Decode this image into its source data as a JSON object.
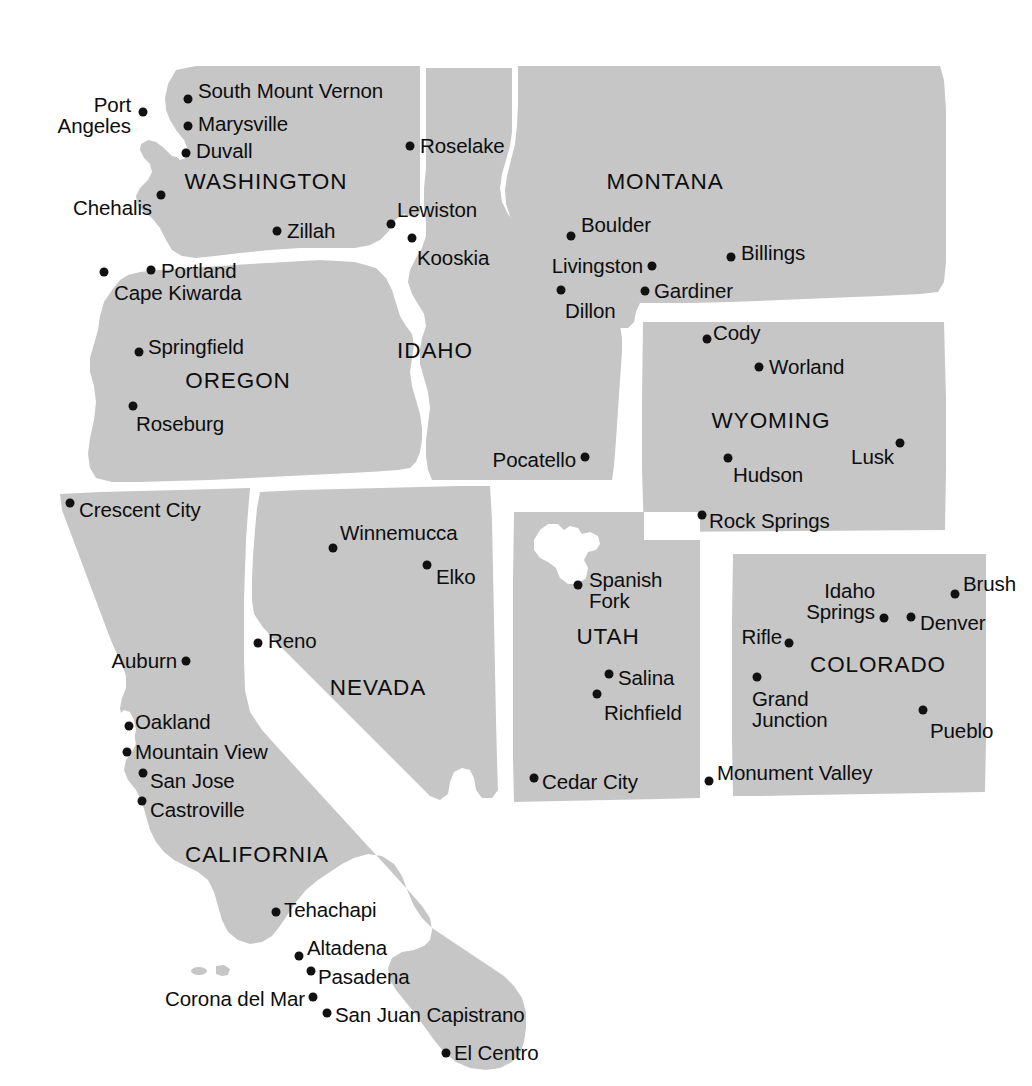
{
  "map": {
    "title": "Western United States",
    "colors": {
      "land": "#c6c6c6",
      "background": "#ffffff",
      "border": "#ffffff",
      "dot": "#111111",
      "text": "#0d0d0d",
      "lake": "#ffffff"
    },
    "width": 1032,
    "height": 1086
  },
  "states": [
    {
      "name": "WASHINGTON",
      "x": 266,
      "y": 182
    },
    {
      "name": "OREGON",
      "x": 238,
      "y": 381
    },
    {
      "name": "IDAHO",
      "x": 435,
      "y": 351
    },
    {
      "name": "MONTANA",
      "x": 665,
      "y": 182
    },
    {
      "name": "WYOMING",
      "x": 771,
      "y": 421
    },
    {
      "name": "NEVADA",
      "x": 378,
      "y": 688
    },
    {
      "name": "UTAH",
      "x": 608,
      "y": 637
    },
    {
      "name": "COLORADO",
      "x": 878,
      "y": 665
    },
    {
      "name": "CALIFORNIA",
      "x": 257,
      "y": 855
    }
  ],
  "cities": [
    {
      "name": "Port\nAngeles",
      "dot_x": 143,
      "dot_y": 112,
      "label_x": 131,
      "label_y": 115,
      "anchor": "end",
      "multiline": true
    },
    {
      "name": "South Mount Vernon",
      "dot_x": 188,
      "dot_y": 99,
      "label_x": 198,
      "label_y": 91,
      "anchor": "start"
    },
    {
      "name": "Marysville",
      "dot_x": 188,
      "dot_y": 126,
      "label_x": 198,
      "label_y": 124,
      "anchor": "start"
    },
    {
      "name": "Duvall",
      "dot_x": 186,
      "dot_y": 153,
      "label_x": 196,
      "label_y": 151,
      "anchor": "start"
    },
    {
      "name": "Chehalis",
      "dot_x": 161,
      "dot_y": 195,
      "label_x": 152,
      "label_y": 208,
      "anchor": "end"
    },
    {
      "name": "Zillah",
      "dot_x": 277,
      "dot_y": 231,
      "label_x": 287,
      "label_y": 231,
      "anchor": "start"
    },
    {
      "name": "Portland",
      "dot_x": 151,
      "dot_y": 270,
      "label_x": 161,
      "label_y": 271,
      "anchor": "start"
    },
    {
      "name": "Cape Kiwarda",
      "dot_x": 104,
      "dot_y": 272,
      "label_x": 114,
      "label_y": 293,
      "anchor": "start"
    },
    {
      "name": "Springfield",
      "dot_x": 139,
      "dot_y": 352,
      "label_x": 148,
      "label_y": 347,
      "anchor": "start"
    },
    {
      "name": "Roseburg",
      "dot_x": 133,
      "dot_y": 406,
      "label_x": 136,
      "label_y": 424,
      "anchor": "start"
    },
    {
      "name": "Roselake",
      "dot_x": 410,
      "dot_y": 146,
      "label_x": 420,
      "label_y": 146,
      "anchor": "start"
    },
    {
      "name": "Lewiston",
      "dot_x": 391,
      "dot_y": 224,
      "label_x": 397,
      "label_y": 210,
      "anchor": "start"
    },
    {
      "name": "Kooskia",
      "dot_x": 412,
      "dot_y": 238,
      "label_x": 417,
      "label_y": 258,
      "anchor": "start"
    },
    {
      "name": "Pocatello",
      "dot_x": 585,
      "dot_y": 457,
      "label_x": 576,
      "label_y": 460,
      "anchor": "end"
    },
    {
      "name": "Boulder",
      "dot_x": 571,
      "dot_y": 236,
      "label_x": 581,
      "label_y": 225,
      "anchor": "start"
    },
    {
      "name": "Livingston",
      "dot_x": 652,
      "dot_y": 266,
      "label_x": 643,
      "label_y": 266,
      "anchor": "end"
    },
    {
      "name": "Billings",
      "dot_x": 731,
      "dot_y": 257,
      "label_x": 741,
      "label_y": 253,
      "anchor": "start"
    },
    {
      "name": "Dillon",
      "dot_x": 561,
      "dot_y": 290,
      "label_x": 565,
      "label_y": 311,
      "anchor": "start"
    },
    {
      "name": "Gardiner",
      "dot_x": 645,
      "dot_y": 291,
      "label_x": 654,
      "label_y": 291,
      "anchor": "start"
    },
    {
      "name": "Cody",
      "dot_x": 707,
      "dot_y": 339,
      "label_x": 713,
      "label_y": 333,
      "anchor": "start"
    },
    {
      "name": "Worland",
      "dot_x": 759,
      "dot_y": 367,
      "label_x": 769,
      "label_y": 367,
      "anchor": "start"
    },
    {
      "name": "Hudson",
      "dot_x": 728,
      "dot_y": 458,
      "label_x": 733,
      "label_y": 475,
      "anchor": "start"
    },
    {
      "name": "Lusk",
      "dot_x": 900,
      "dot_y": 443,
      "label_x": 894,
      "label_y": 457,
      "anchor": "end"
    },
    {
      "name": "Rock Springs",
      "dot_x": 702,
      "dot_y": 515,
      "label_x": 709,
      "label_y": 521,
      "anchor": "start"
    },
    {
      "name": "Crescent City",
      "dot_x": 70,
      "dot_y": 503,
      "label_x": 79,
      "label_y": 510,
      "anchor": "start"
    },
    {
      "name": "Winnemucca",
      "dot_x": 333,
      "dot_y": 548,
      "label_x": 340,
      "label_y": 533,
      "anchor": "start"
    },
    {
      "name": "Elko",
      "dot_x": 427,
      "dot_y": 565,
      "label_x": 436,
      "label_y": 577,
      "anchor": "start"
    },
    {
      "name": "Reno",
      "dot_x": 258,
      "dot_y": 643,
      "label_x": 268,
      "label_y": 641,
      "anchor": "start"
    },
    {
      "name": "Auburn",
      "dot_x": 186,
      "dot_y": 661,
      "label_x": 177,
      "label_y": 661,
      "anchor": "end"
    },
    {
      "name": "Oakland",
      "dot_x": 129,
      "dot_y": 726,
      "label_x": 135,
      "label_y": 722,
      "anchor": "start"
    },
    {
      "name": "Mountain View",
      "dot_x": 127,
      "dot_y": 752,
      "label_x": 135,
      "label_y": 752,
      "anchor": "start"
    },
    {
      "name": "San Jose",
      "dot_x": 143,
      "dot_y": 773,
      "label_x": 150,
      "label_y": 781,
      "anchor": "start"
    },
    {
      "name": "Castroville",
      "dot_x": 142,
      "dot_y": 801,
      "label_x": 150,
      "label_y": 810,
      "anchor": "start"
    },
    {
      "name": "Tehachapi",
      "dot_x": 276,
      "dot_y": 912,
      "label_x": 284,
      "label_y": 910,
      "anchor": "start"
    },
    {
      "name": "Altadena",
      "dot_x": 299,
      "dot_y": 956,
      "label_x": 307,
      "label_y": 948,
      "anchor": "start"
    },
    {
      "name": "Pasadena",
      "dot_x": 311,
      "dot_y": 971,
      "label_x": 318,
      "label_y": 977,
      "anchor": "start"
    },
    {
      "name": "Corona del Mar",
      "dot_x": 313,
      "dot_y": 997,
      "label_x": 305,
      "label_y": 999,
      "anchor": "end"
    },
    {
      "name": "San Juan Capistrano",
      "dot_x": 327,
      "dot_y": 1013,
      "label_x": 335,
      "label_y": 1015,
      "anchor": "start"
    },
    {
      "name": "El Centro",
      "dot_x": 446,
      "dot_y": 1053,
      "label_x": 454,
      "label_y": 1053,
      "anchor": "start"
    },
    {
      "name": "Spanish\nFork",
      "dot_x": 578,
      "dot_y": 585,
      "label_x": 589,
      "label_y": 590,
      "anchor": "start",
      "multiline": true
    },
    {
      "name": "Salina",
      "dot_x": 609,
      "dot_y": 674,
      "label_x": 618,
      "label_y": 678,
      "anchor": "start"
    },
    {
      "name": "Richfield",
      "dot_x": 597,
      "dot_y": 694,
      "label_x": 604,
      "label_y": 713,
      "anchor": "start"
    },
    {
      "name": "Cedar City",
      "dot_x": 534,
      "dot_y": 778,
      "label_x": 542,
      "label_y": 782,
      "anchor": "start"
    },
    {
      "name": "Monument Valley",
      "dot_x": 709,
      "dot_y": 781,
      "label_x": 717,
      "label_y": 773,
      "anchor": "start"
    },
    {
      "name": "Idaho\nSprings",
      "dot_x": 884,
      "dot_y": 618,
      "label_x": 875,
      "label_y": 601,
      "anchor": "end",
      "multiline": true
    },
    {
      "name": "Brush",
      "dot_x": 955,
      "dot_y": 594,
      "label_x": 963,
      "label_y": 584,
      "anchor": "start"
    },
    {
      "name": "Denver",
      "dot_x": 911,
      "dot_y": 617,
      "label_x": 920,
      "label_y": 623,
      "anchor": "start"
    },
    {
      "name": "Rifle",
      "dot_x": 789,
      "dot_y": 643,
      "label_x": 782,
      "label_y": 637,
      "anchor": "end"
    },
    {
      "name": "Grand\nJunction",
      "dot_x": 757,
      "dot_y": 677,
      "label_x": 752,
      "label_y": 709,
      "anchor": "start",
      "multiline": true
    },
    {
      "name": "Pueblo",
      "dot_x": 923,
      "dot_y": 710,
      "label_x": 930,
      "label_y": 731,
      "anchor": "start"
    }
  ]
}
